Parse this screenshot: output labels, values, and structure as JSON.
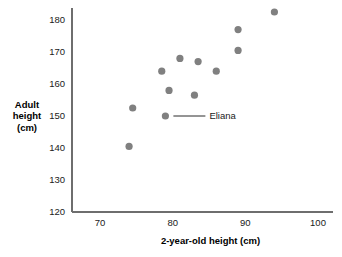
{
  "chart_data": {
    "type": "scatter",
    "title": "",
    "xlabel": "2-year-old height (cm)",
    "ylabel": "Adult height (cm)",
    "ylabel_lines": [
      "Adult",
      "height",
      "(cm)"
    ],
    "xlim": [
      65,
      103
    ],
    "ylim": [
      120,
      185
    ],
    "xticks": [
      70,
      80,
      90,
      100
    ],
    "xtick_labels": [
      "70",
      "80",
      "90",
      "100"
    ],
    "yticks": [
      120,
      130,
      140,
      150,
      160,
      170,
      180
    ],
    "ytick_labels": [
      "120",
      "130",
      "140",
      "150",
      "160",
      "170",
      "180"
    ],
    "grid": false,
    "legend": false,
    "point_color": "#808080",
    "axis_color": "#6e6e6e",
    "text_color": "#1a1a1a",
    "points": [
      {
        "x": 74.0,
        "y": 140.5,
        "label": ""
      },
      {
        "x": 74.5,
        "y": 152.5,
        "label": ""
      },
      {
        "x": 78.5,
        "y": 164.0,
        "label": ""
      },
      {
        "x": 79.0,
        "y": 150.0,
        "label": "Eliana"
      },
      {
        "x": 79.5,
        "y": 158.0,
        "label": ""
      },
      {
        "x": 81.0,
        "y": 168.0,
        "label": ""
      },
      {
        "x": 83.0,
        "y": 156.5,
        "label": ""
      },
      {
        "x": 83.5,
        "y": 167.0,
        "label": ""
      },
      {
        "x": 86.0,
        "y": 164.0,
        "label": ""
      },
      {
        "x": 89.0,
        "y": 170.5,
        "label": ""
      },
      {
        "x": 89.0,
        "y": 177.0,
        "label": ""
      },
      {
        "x": 94.0,
        "y": 182.5,
        "label": ""
      }
    ],
    "annotations": [
      {
        "text": "Eliana",
        "point_x": 79.0,
        "point_y": 150.0
      }
    ]
  }
}
